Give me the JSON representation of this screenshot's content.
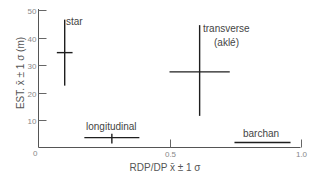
{
  "chart_data": {
    "type": "scatter",
    "subtype": "error-bar cross plot",
    "title": "",
    "xlabel": "RDP/DP x̄ ± 1 σ",
    "ylabel": "EST. x̄ ± 1 σ (m)",
    "xlim": [
      0,
      1.0
    ],
    "ylim": [
      0,
      50
    ],
    "x_ticks": [
      {
        "value": 0,
        "label": "0"
      },
      {
        "value": 0.5,
        "label": "0.5"
      },
      {
        "value": 1.0,
        "label": "1.0"
      }
    ],
    "y_ticks": [
      {
        "value": 10,
        "label": "10"
      },
      {
        "value": 20,
        "label": "20"
      },
      {
        "value": 30,
        "label": "30"
      },
      {
        "value": 40,
        "label": "40"
      },
      {
        "value": 50,
        "label": "50"
      }
    ],
    "grid": false,
    "legend": null,
    "series": [
      {
        "name": "star",
        "label_lines": [
          "star"
        ],
        "x": 0.1,
        "x_err": 0.03,
        "y": 34.5,
        "y_low": 22.5,
        "y_high": 46.5
      },
      {
        "name": "transverse (aklé)",
        "label_lines": [
          "transverse",
          "(aklé)"
        ],
        "x": 0.615,
        "x_err": 0.115,
        "y": 27.5,
        "y_low": 11.5,
        "y_high": 44.5
      },
      {
        "name": "longitudinal",
        "label_lines": [
          "longitudinal"
        ],
        "x": 0.28,
        "x_err": 0.105,
        "y": 3.6,
        "y_low": 1.5,
        "y_high": 5.0
      },
      {
        "name": "barchan",
        "label_lines": [
          "barchan"
        ],
        "x": 0.855,
        "x_err": 0.107,
        "y": 1.8,
        "y_low": 1.8,
        "y_high": 1.8
      }
    ]
  },
  "labels": {
    "origin": "0",
    "x_axis_title": "RDP/DP x̄ ± 1 σ",
    "y_axis_title": "EST. x̄ ± 1 σ (m)",
    "star": "star",
    "transverse": "transverse",
    "transverse_sub": "(aklé)",
    "longitudinal": "longitudinal",
    "barchan": "barchan"
  }
}
